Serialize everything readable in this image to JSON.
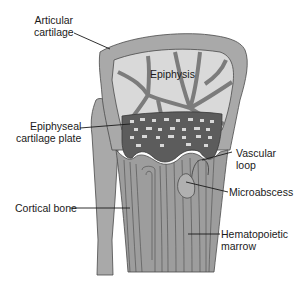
{
  "diagram": {
    "type": "anatomical-cross-section",
    "colors": {
      "cartilage": "#a9a9a9",
      "epiphysis_fill": "#d9d9d9",
      "trabecula": "#8c8c8c",
      "growth_plate": "#5c5c5c",
      "marrow": "#9d9d9d",
      "outline": "#4a4a4a",
      "leader_line": "#1a1a1a"
    },
    "labels": {
      "articular_cartilage_line1": "Articular",
      "articular_cartilage_line2": "cartilage",
      "epiphysis": "Epiphysis",
      "epiphyseal_plate_line1": "Epiphyseal",
      "epiphyseal_plate_line2": "cartilage plate",
      "vascular_loop_line1": "Vascular",
      "vascular_loop_line2": "loop",
      "microabscess": "Microabscess",
      "cortical_bone": "Cortical bone",
      "hematopoietic_marrow_line1": "Hematopoietic",
      "hematopoietic_marrow_line2": "marrow"
    }
  }
}
